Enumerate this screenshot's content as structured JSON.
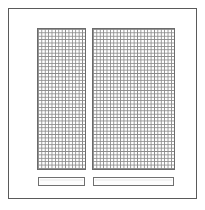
{
  "figure": {
    "kind": "technical-line-drawing",
    "canvas_width": 205,
    "canvas_height": 210,
    "background_color": "#ffffff"
  },
  "frame": {
    "label": "outer-frame",
    "stroke_color": "#5a5a5a",
    "stroke_width": 1,
    "x": 8,
    "y": 8,
    "width": 189,
    "height": 191
  },
  "panels": [
    {
      "label": "left-mesh-panel",
      "x": 37,
      "y": 28,
      "width": 49,
      "height": 142,
      "grid_cell_px": 3.4,
      "grid_line_color": "#8a8a8a",
      "border_color": "#6b6b6b",
      "fill_color": "#ffffff",
      "columns": 14,
      "rows": 42
    },
    {
      "label": "right-mesh-panel",
      "x": 92,
      "y": 28,
      "width": 83,
      "height": 142,
      "grid_cell_px": 3.4,
      "grid_line_color": "#8a8a8a",
      "border_color": "#6b6b6b",
      "fill_color": "#ffffff",
      "columns": 24,
      "rows": 42
    }
  ],
  "bars": [
    {
      "label": "left-slat-bar",
      "x": 38,
      "y": 177,
      "width": 47,
      "height": 9,
      "stroke_color": "#6f6f6f",
      "fill_color": "#fdfdfd"
    },
    {
      "label": "right-slat-bar",
      "x": 93,
      "y": 177,
      "width": 81,
      "height": 9,
      "stroke_color": "#6f6f6f",
      "fill_color": "#fdfdfd"
    }
  ],
  "annotations": {
    "has_text_labels": false,
    "has_leader_lines": false,
    "has_dimension_marks": false
  },
  "colors": {
    "background": "#ffffff",
    "frame_stroke": "#5a5a5a",
    "mesh_line": "#8a8a8a",
    "mesh_border": "#6b6b6b",
    "bar_stroke": "#6f6f6f"
  }
}
